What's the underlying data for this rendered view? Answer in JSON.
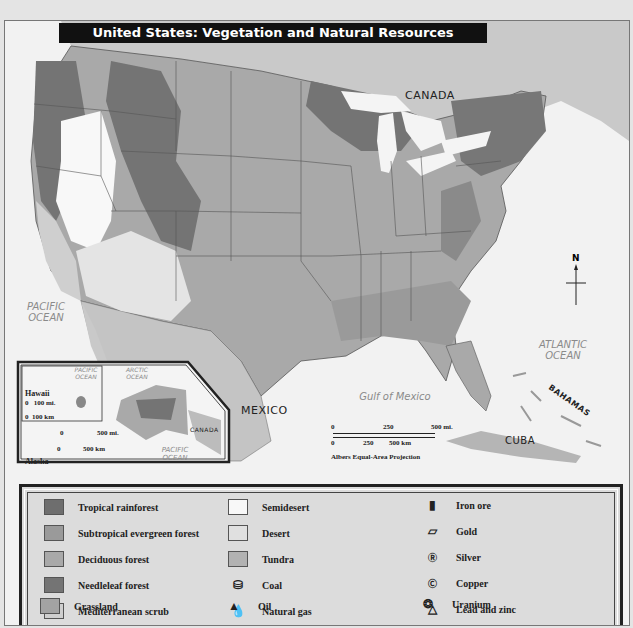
{
  "title": "United States:  Vegetation and Natural Resources",
  "map_labels": {
    "canada": "CANADA",
    "mexico": "MEXICO",
    "cuba": "CUBA",
    "bahamas": "BAHAMAS",
    "pacific_ocean": "PACIFIC OCEAN",
    "atlantic_ocean": "ATLANTIC OCEAN",
    "gulf_of_mexico": "Gulf of Mexico",
    "north": "N"
  },
  "scale_bar": {
    "miles": [
      "0",
      "250",
      "500 mi."
    ],
    "km": [
      "0",
      "250",
      "500 km"
    ],
    "projection": "Albers Equal-Area Projection"
  },
  "inset": {
    "hawaii": {
      "label": "Hawaii",
      "scale_mi": "0   100 mi.",
      "scale_km": "0  100 km",
      "ocean": "PACIFIC OCEAN"
    },
    "alaska": {
      "label": "Alaska",
      "scale_mi_0": "0",
      "scale_mi_1": "500 mi.",
      "scale_km_0": "0",
      "scale_km_1": "500 km",
      "arctic": "ARCTIC OCEAN",
      "pacific": "PACIFIC OCEAN",
      "canada": "CANADA"
    }
  },
  "legend": {
    "vegetation": [
      {
        "label": "Tropical rainforest",
        "color": "#6e6e6e"
      },
      {
        "label": "Subtropical evergreen forest",
        "color": "#9a9a9a"
      },
      {
        "label": "Deciduous forest",
        "color": "#a9a9a9"
      },
      {
        "label": "Needleleaf forest",
        "color": "#747474"
      },
      {
        "label": "Mediterranean scrub",
        "color": "#cfcfcf"
      },
      {
        "label": "Grassland",
        "color": "#a3a3a3"
      },
      {
        "label": "Semidesert",
        "color": "#f8f8f8"
      },
      {
        "label": "Desert",
        "color": "#e0e0e0"
      },
      {
        "label": "Tundra",
        "color": "#b2b2b2"
      }
    ],
    "resources": [
      {
        "label": "Coal",
        "icon": "coal-icon"
      },
      {
        "label": "Natural gas",
        "icon": "natural-gas-icon"
      },
      {
        "label": "Oil",
        "icon": "oil-icon"
      },
      {
        "label": "Iron ore",
        "icon": "iron-ore-icon"
      },
      {
        "label": "Gold",
        "icon": "gold-icon"
      },
      {
        "label": "Silver",
        "icon": "silver-icon"
      },
      {
        "label": "Copper",
        "icon": "copper-icon"
      },
      {
        "label": "Lead and zinc",
        "icon": "lead-zinc-icon"
      },
      {
        "label": "Uranium",
        "icon": "uranium-icon"
      }
    ]
  }
}
